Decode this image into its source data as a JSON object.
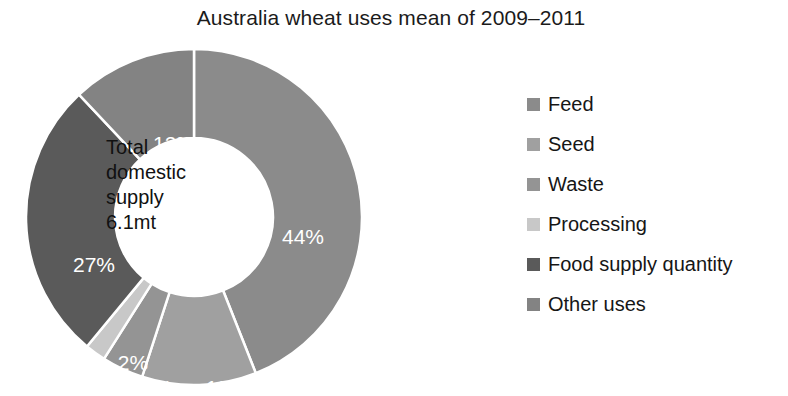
{
  "chart_data": {
    "type": "pie",
    "variant": "donut",
    "title": "Australia wheat uses mean of 2009–2011",
    "xlabel": "",
    "ylabel": "",
    "units": "percent",
    "start_angle_deg": 0,
    "direction": "clockwise",
    "inner_radius_ratio": 0.47,
    "grid": false,
    "legend_position": "right",
    "center_label_lines": [
      "Total",
      "domestic",
      "supply",
      "6.1mt"
    ],
    "center_total_value": "6.1mt",
    "categories": [
      "Feed",
      "Seed",
      "Waste",
      "Processing",
      "Food supply quantity",
      "Other uses"
    ],
    "values": [
      44,
      11,
      4,
      2,
      27,
      12
    ],
    "data_labels": [
      "44%",
      "11%",
      "4%",
      "2%",
      "27%",
      "12%"
    ],
    "colors": [
      "#8b8b8b",
      "#a0a0a0",
      "#949494",
      "#c8c8c8",
      "#5a5a5a",
      "#838383"
    ],
    "slices": [
      {
        "label": "Feed",
        "value": 44,
        "data_label": "44%",
        "color": "#8b8b8b",
        "start_deg": 0,
        "end_deg": 158.4,
        "label_x": 279,
        "label_y": 197
      },
      {
        "label": "Seed",
        "value": 11,
        "data_label": "11%",
        "color": "#a0a0a0",
        "start_deg": 158.4,
        "end_deg": 198,
        "label_x": 202,
        "label_y": 348
      },
      {
        "label": "Waste",
        "value": 4,
        "data_label": "4%",
        "color": "#949494",
        "start_deg": 198,
        "end_deg": 212.4,
        "label_x": 133,
        "label_y": 348
      },
      {
        "label": "Processing",
        "value": 2,
        "data_label": "2%",
        "color": "#c8c8c8",
        "start_deg": 212.4,
        "end_deg": 219.6,
        "label_x": 109,
        "label_y": 323
      },
      {
        "label": "Food supply quantity",
        "value": 27,
        "data_label": "27%",
        "color": "#5a5a5a",
        "start_deg": 219.6,
        "end_deg": 316.8,
        "label_x": 70,
        "label_y": 225
      },
      {
        "label": "Other uses",
        "value": 12,
        "data_label": "12%",
        "color": "#838383",
        "start_deg": 316.8,
        "end_deg": 360,
        "label_x": 150,
        "label_y": 104
      }
    ]
  },
  "legend": {
    "items": [
      {
        "label": "Feed",
        "color": "#8b8b8b"
      },
      {
        "label": "Seed",
        "color": "#a0a0a0"
      },
      {
        "label": "Waste",
        "color": "#949494"
      },
      {
        "label": "Processing",
        "color": "#c8c8c8"
      },
      {
        "label": "Food supply quantity",
        "color": "#5a5a5a"
      },
      {
        "label": "Other uses",
        "color": "#838383"
      }
    ]
  },
  "center": {
    "line1": "Total",
    "line2": "domestic",
    "line3": "supply",
    "line4": "6.1mt"
  }
}
